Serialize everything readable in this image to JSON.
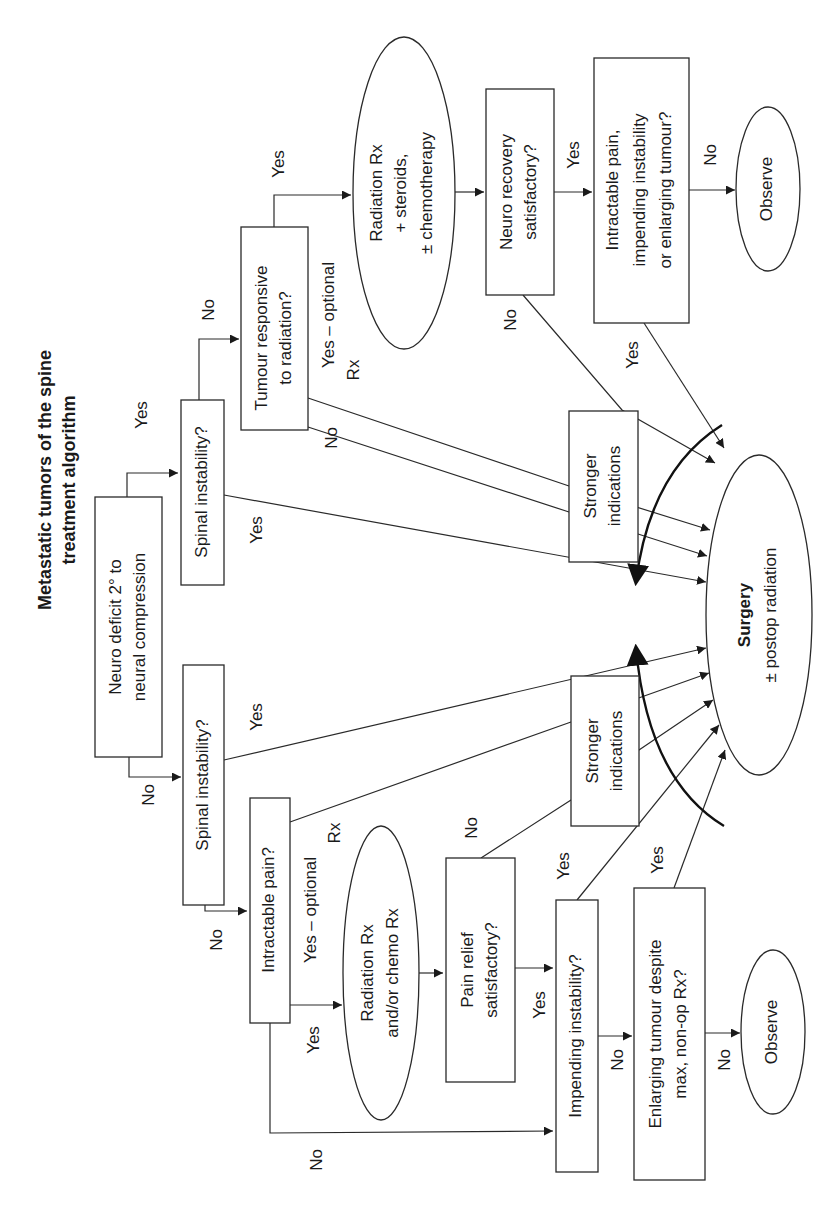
{
  "title": {
    "line1": "Metastatic tumors of the spine",
    "line2": "treatment algorithm"
  },
  "nodes": {
    "neuro_deficit": {
      "line1": "Neuro deficit 2° to",
      "line2": "neural compression"
    },
    "spinal_instability_top": {
      "line1": "Spinal instability?"
    },
    "spinal_instability_bottom": {
      "line1": "Spinal instability?"
    },
    "tumour_responsive": {
      "line1": "Tumour responsive",
      "line2": "to radiation?"
    },
    "radiation_steroids": {
      "line1": "Radiation Rx",
      "line2": "+ steroids,",
      "line3": "± chemotherapy"
    },
    "neuro_recovery": {
      "line1": "Neuro recovery",
      "line2": "satisfactory?"
    },
    "intractable_impending_enlarging": {
      "line1": "Intractable pain,",
      "line2": "impending instability",
      "line3": "or enlarging tumour?"
    },
    "observe_top": {
      "line1": "Observe"
    },
    "stronger_top": {
      "line1": "Stronger",
      "line2": "indications"
    },
    "stronger_bottom": {
      "line1": "Stronger",
      "line2": "indications"
    },
    "surgery": {
      "line1": "Surgery",
      "line2": "± postop radiation"
    },
    "intractable_pain": {
      "line1": "Intractable pain?"
    },
    "radiation_chemo": {
      "line1": "Radiation Rx",
      "line2": "and/or chemo Rx"
    },
    "pain_relief": {
      "line1": "Pain relief",
      "line2": "satisfactory?"
    },
    "impending_instability": {
      "line1": "Impending instability?"
    },
    "enlarging_tumour": {
      "line1": "Enlarging tumour despite",
      "line2": "max, non-op Rx?"
    },
    "observe_bottom": {
      "line1": "Observe"
    }
  },
  "edge_labels": {
    "neuro_yes": "Yes",
    "neuro_no": "No",
    "spinal_top_no": "No",
    "spinal_top_yes": "Yes",
    "tumour_yes": "Yes",
    "tumour_yes_optional_1": "Yes – optional",
    "tumour_yes_optional_2": "Rx",
    "tumour_no": "No",
    "neuro_recovery_yes": "Yes",
    "neuro_recovery_no": "No",
    "intractable_impending_no": "No",
    "intractable_impending_yes": "Yes",
    "spinal_bottom_yes": "Yes",
    "spinal_bottom_no": "No",
    "intractable_yes_optional_1": "Yes – optional",
    "intractable_yes_optional_2": "Rx",
    "intractable_yes": "Yes",
    "intractable_no": "No",
    "pain_relief_no": "No",
    "pain_relief_yes": "Yes",
    "impending_yes": "Yes",
    "impending_no": "No",
    "enlarging_yes": "Yes",
    "enlarging_no": "No"
  },
  "colors": {
    "stroke": "#2a2a2a",
    "background": "#ffffff",
    "text": "#1a1a1a"
  }
}
